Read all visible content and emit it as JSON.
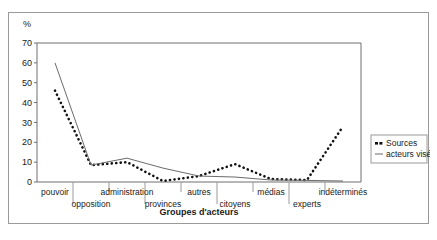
{
  "figure": {
    "unit_label": "%",
    "axis_title_x": "Groupes d'acteurs"
  },
  "legend": {
    "position": "right",
    "items": [
      {
        "label": "Sources",
        "marker": "dotted-square",
        "color": "#111111"
      },
      {
        "label": "acteurs visés",
        "marker": "solid-line",
        "color": "#6b6b6b"
      }
    ]
  },
  "chart_data": {
    "type": "line",
    "title": "",
    "xlabel": "Groupes d'acteurs",
    "ylabel": "%",
    "ylim": [
      0,
      70
    ],
    "yticks": [
      0,
      10,
      20,
      30,
      40,
      50,
      60,
      70
    ],
    "grid": false,
    "legend_position": "right",
    "categories": [
      "pouvoir",
      "opposition",
      "administration",
      "provinces",
      "autres",
      "citoyens",
      "médias",
      "experts",
      "indéterminés"
    ],
    "series": [
      {
        "name": "Sources",
        "style": "dotted",
        "color": "#111111",
        "values": [
          46,
          8.5,
          10,
          0.5,
          3,
          9,
          1.5,
          1,
          28
        ]
      },
      {
        "name": "acteurs visés",
        "style": "solid",
        "color": "#6b6b6b",
        "values": [
          60,
          8.5,
          12,
          7,
          3,
          2.5,
          1,
          0.8,
          0.5
        ]
      }
    ]
  }
}
